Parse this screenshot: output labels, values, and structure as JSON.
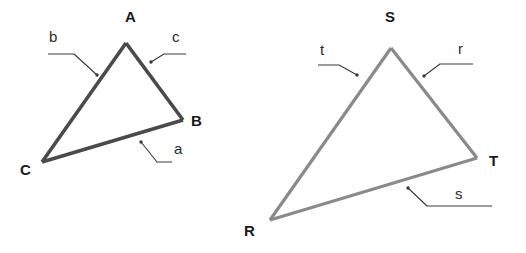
{
  "figure": {
    "background_color": "#ffffff",
    "width": 526,
    "height": 253
  },
  "triangle_left": {
    "name": "triangle-abc",
    "stroke_color": "#4a4a4a",
    "stroke_width": 3.6,
    "vertices": [
      {
        "id": "A",
        "label": "A",
        "x": 126,
        "y": 43,
        "label_x": 125,
        "label_y": 22
      },
      {
        "id": "B",
        "label": "B",
        "x": 183,
        "y": 120,
        "label_x": 191,
        "label_y": 126
      },
      {
        "id": "C",
        "label": "C",
        "x": 42,
        "y": 162,
        "label_x": 20,
        "label_y": 175
      }
    ],
    "sides": [
      {
        "id": "a",
        "label": "a",
        "between": "C-B",
        "label_x": 174,
        "label_y": 154,
        "leader": "M 172 162 L 157 162 L 141 142",
        "arrow_x": 141,
        "arrow_y": 142
      },
      {
        "id": "b",
        "label": "b",
        "between": "A-C",
        "label_x": 49,
        "label_y": 42,
        "leader": "M 48 54 L 74 54 L 97 75",
        "arrow_x": 97,
        "arrow_y": 75
      },
      {
        "id": "c",
        "label": "c",
        "between": "A-B",
        "label_x": 172,
        "label_y": 42,
        "leader": "M 186 54 L 164 54 L 151 62",
        "arrow_x": 151,
        "arrow_y": 62
      }
    ]
  },
  "triangle_right": {
    "name": "triangle-rst",
    "stroke_color": "#8a8a8a",
    "stroke_width": 3.2,
    "vertices": [
      {
        "id": "S",
        "label": "S",
        "x": 391,
        "y": 48,
        "label_x": 385,
        "label_y": 22
      },
      {
        "id": "T",
        "label": "T",
        "x": 477,
        "y": 158,
        "label_x": 489,
        "label_y": 166
      },
      {
        "id": "R",
        "label": "R",
        "x": 270,
        "y": 220,
        "label_x": 244,
        "label_y": 236
      }
    ],
    "sides": [
      {
        "id": "r",
        "label": "r",
        "between": "S-T",
        "label_x": 458,
        "label_y": 54,
        "leader": "M 473 64 L 440 64 L 424 76",
        "arrow_x": 424,
        "arrow_y": 76
      },
      {
        "id": "s",
        "label": "s",
        "between": "R-T",
        "label_x": 455,
        "label_y": 199,
        "leader": "M 492 206 L 427 206 L 408 188",
        "arrow_x": 408,
        "arrow_y": 188
      },
      {
        "id": "t",
        "label": "t",
        "between": "S-R",
        "label_x": 320,
        "label_y": 55,
        "leader": "M 318 65 L 339 65 L 357 75",
        "arrow_x": 357,
        "arrow_y": 75
      }
    ]
  },
  "leader_style": {
    "stroke_color": "#3a3a3a",
    "stroke_width": 1.1,
    "dot_radius": 1.7
  }
}
